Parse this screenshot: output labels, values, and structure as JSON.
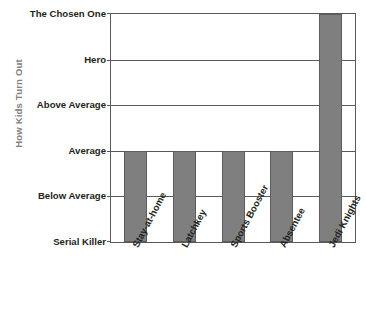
{
  "chart_data": {
    "type": "bar",
    "title": "",
    "subtitle": "",
    "xlabel": "",
    "ylabel": "How Kids Turn Out",
    "categories": [
      "Stay-at-home",
      "Latchkey",
      "Sports Booster",
      "Absentee",
      "Jedi Knights"
    ],
    "values": [
      3,
      3,
      3,
      3,
      6
    ],
    "value_labels": [
      "Average",
      "Average",
      "Average",
      "Average",
      "The Chosen One"
    ],
    "ytick_labels": [
      "The Chosen One",
      "Hero",
      "Above Average",
      "Average",
      "Below Average",
      "Serial Killer"
    ],
    "ytick_values": [
      6,
      5,
      4,
      3,
      2,
      1
    ],
    "ylim": [
      1,
      6
    ],
    "grid": true,
    "legend": false,
    "legend_position": "none",
    "series": [
      {
        "name": "How Kids Turn Out",
        "values": [
          3,
          3,
          3,
          3,
          6
        ]
      }
    ],
    "colors": {
      "bar_fill": "#7f7f7f",
      "bar_stroke": "#5d5d5d",
      "axis": "#595959",
      "grid": "#595959",
      "tick_text": "#231f20",
      "axis_title": "#808080",
      "background": "#ffffff"
    }
  }
}
